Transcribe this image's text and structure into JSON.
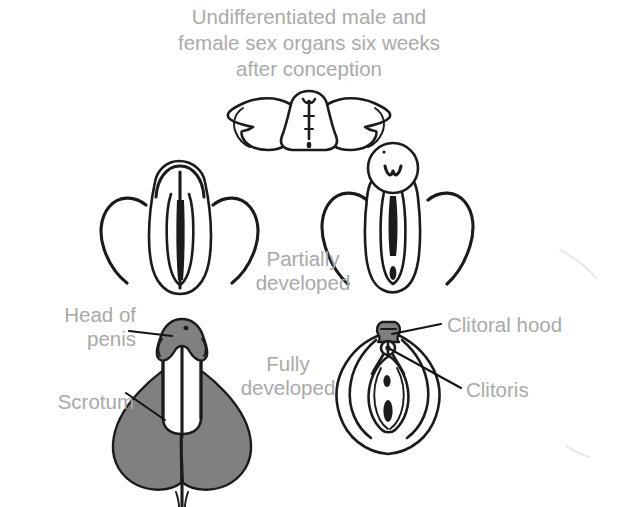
{
  "figure": {
    "kind": "anatomical-diagram",
    "background_color": "#ffffff",
    "text_color": "#a9a9a9",
    "line_color": "#1a1a1a",
    "shading_color": "#808080"
  },
  "title": {
    "lines": [
      "Undifferentiated male and",
      "female sex organs six weeks",
      "after conception"
    ]
  },
  "stages": {
    "partially_developed": "Partially\ndeveloped",
    "partially_developed_line1": "Partially",
    "partially_developed_line2": "developed",
    "fully_developed_line1": "Fully",
    "fully_developed_line2": "developed"
  },
  "labels": {
    "head_of_penis_line1": "Head of",
    "head_of_penis_line2": "penis",
    "scrotum": "Scrotum",
    "clitoral_hood": "Clitoral hood",
    "clitoris": "Clitoris"
  },
  "panels": [
    {
      "id": "undifferentiated",
      "stage": "Undifferentiated (six weeks after conception)",
      "row": 1,
      "position": "center",
      "parts": [
        "genital tubercle",
        "urethral groove",
        "labioscrotal swellings"
      ]
    },
    {
      "id": "partial-male",
      "stage": "Partially developed",
      "row": 2,
      "position": "left",
      "sex": "male",
      "parts": [
        "elongating genital tubercle",
        "urethral groove",
        "labioscrotal swellings"
      ]
    },
    {
      "id": "partial-female",
      "stage": "Partially developed",
      "row": 2,
      "position": "right",
      "sex": "female",
      "parts": [
        "genital tubercle",
        "urogenital groove",
        "labioscrotal swellings"
      ]
    },
    {
      "id": "full-male",
      "stage": "Fully developed",
      "row": 3,
      "position": "left",
      "sex": "male",
      "parts": [
        "head of penis",
        "shaft of penis",
        "scrotum",
        "perineal raphe"
      ]
    },
    {
      "id": "full-female",
      "stage": "Fully developed",
      "row": 3,
      "position": "right",
      "sex": "female",
      "parts": [
        "clitoral hood",
        "clitoris",
        "labia majora",
        "labia minora",
        "urethral opening",
        "vaginal opening"
      ]
    }
  ]
}
